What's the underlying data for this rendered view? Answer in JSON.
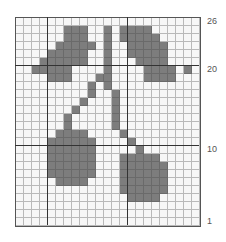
{
  "chart": {
    "columns": 23,
    "rows": 26,
    "fill_color": "#7d7d7d",
    "row_labels": [
      {
        "label": "26",
        "row": 26
      },
      {
        "label": "20",
        "row": 20
      },
      {
        "label": "10",
        "row": 10
      },
      {
        "label": "1",
        "row": 1
      }
    ],
    "thick_columns": [
      4,
      14
    ],
    "thick_rows_above": [
      20,
      10
    ],
    "filled": {
      "25": [
        6,
        7,
        8,
        11,
        13,
        14,
        15,
        16
      ],
      "24": [
        6,
        7,
        8,
        11,
        13,
        14,
        15,
        16,
        17
      ],
      "23": [
        5,
        6,
        7,
        8,
        9,
        11,
        14,
        15,
        16,
        17,
        18
      ],
      "22": [
        4,
        5,
        6,
        7,
        8,
        11,
        14,
        15,
        16,
        17,
        18
      ],
      "21": [
        3,
        4,
        5,
        6,
        7,
        8,
        11,
        15,
        16,
        17,
        18
      ],
      "20": [
        2,
        3,
        4,
        5,
        6,
        11,
        16,
        17,
        18,
        19,
        21
      ],
      "19": [
        4,
        5,
        6,
        10,
        11,
        16,
        17,
        18,
        19
      ],
      "18": [
        9,
        11
      ],
      "17": [
        9,
        12
      ],
      "16": [
        8,
        12
      ],
      "15": [
        7,
        12
      ],
      "14": [
        6,
        12
      ],
      "13": [
        6,
        12
      ],
      "12": [
        5,
        6,
        7,
        8,
        13
      ],
      "11": [
        4,
        5,
        6,
        7,
        8,
        9,
        14
      ],
      "10": [
        4,
        5,
        6,
        7,
        8,
        9,
        15
      ],
      "9": [
        4,
        5,
        6,
        7,
        8,
        9,
        13,
        14,
        15,
        16,
        17
      ],
      "8": [
        4,
        5,
        6,
        7,
        8,
        9,
        13,
        14,
        15,
        16,
        17,
        18
      ],
      "7": [
        4,
        5,
        6,
        7,
        8,
        9,
        13,
        14,
        15,
        16,
        17,
        18
      ],
      "6": [
        5,
        6,
        7,
        8,
        13,
        14,
        15,
        16,
        17,
        18
      ],
      "5": [
        13,
        14,
        15,
        16,
        17,
        18
      ],
      "4": [
        14,
        15,
        16,
        17
      ]
    }
  }
}
